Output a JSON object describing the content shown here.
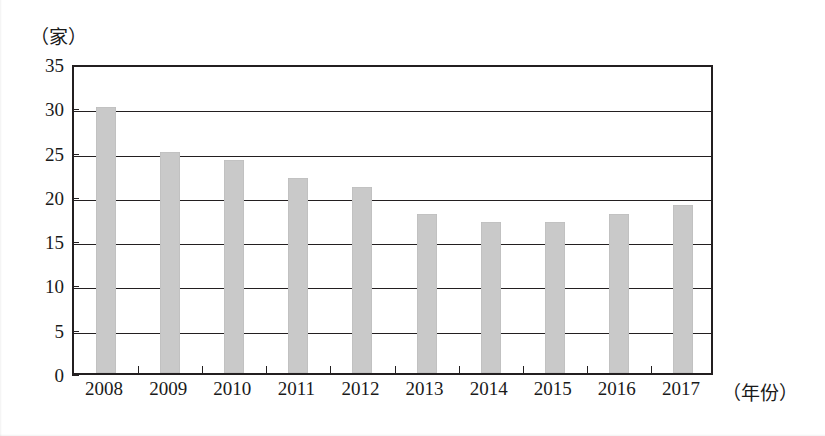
{
  "chart_data": {
    "type": "bar",
    "title": "",
    "subtitle": "",
    "xlabel": "（年份）",
    "ylabel": "（家）",
    "categories": [
      "2008",
      "2009",
      "2010",
      "2011",
      "2012",
      "2013",
      "2014",
      "2015",
      "2016",
      "2017"
    ],
    "values": [
      30,
      25,
      24,
      22,
      21,
      18,
      17,
      17,
      18,
      19
    ],
    "ylim": [
      0,
      35
    ],
    "ytick_labels": [
      "0",
      "5",
      "10",
      "15",
      "20",
      "25",
      "30",
      "35"
    ],
    "ytick_values": [
      0,
      5,
      10,
      15,
      20,
      25,
      30,
      35
    ],
    "grid": true,
    "grid_axis": "y",
    "legend": false,
    "legend_position": "none",
    "series": [
      {
        "name": "",
        "values": [
          30,
          25,
          24,
          22,
          21,
          18,
          17,
          17,
          18,
          19
        ],
        "color": "#c9c9c9"
      }
    ],
    "annotations": []
  },
  "style": {
    "bar_color": "#c9c9c9",
    "axis_color": "#231f20",
    "grid_color": "#231f20",
    "background": "#ffffff"
  }
}
